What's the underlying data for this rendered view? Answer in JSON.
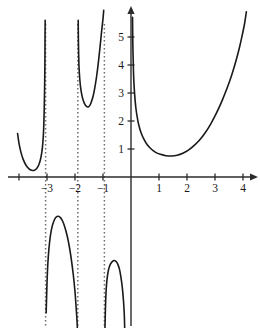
{
  "chart_data": {
    "type": "line",
    "title": "",
    "subtitle": "",
    "xlabel": "",
    "ylabel": "",
    "xlim": [
      -4.4,
      4.45
    ],
    "ylim": [
      -5.4,
      5.95
    ],
    "grid": false,
    "legend": null,
    "axis_origin_px": {
      "x": 131,
      "y": 177
    },
    "px_per_unit": {
      "x": 28.0,
      "y": 28.0
    },
    "x_ticks": [
      {
        "value": -3,
        "label": "−3"
      },
      {
        "value": -2,
        "label": "−2"
      },
      {
        "value": -1,
        "label": "−1"
      },
      {
        "value": 1,
        "label": "1"
      },
      {
        "value": 2,
        "label": "2"
      },
      {
        "value": 3,
        "label": "3"
      },
      {
        "value": 4,
        "label": "4"
      }
    ],
    "x_unlabeled_ticks": [
      -4
    ],
    "y_ticks": [
      {
        "value": 1,
        "label": "1"
      },
      {
        "value": 2,
        "label": "2"
      },
      {
        "value": 3,
        "label": "3"
      },
      {
        "value": 4,
        "label": "4"
      },
      {
        "value": 5,
        "label": "5"
      }
    ],
    "vertical_asymptotes": [
      -3.05,
      -1.9,
      -0.95,
      0
    ],
    "asymptote_style": "dotted",
    "axis_arrows": {
      "x_right": true,
      "y_up": true
    },
    "branches": [
      {
        "name": "far-left-branch",
        "region": "x < -3.05",
        "description": "U-shaped branch above the x-axis, entering at upper left, dipping to a minimum then rising steeply to the asymptote at x = -3.05",
        "points": [
          [
            -4.05,
            1.55
          ],
          [
            -4.0,
            1.2
          ],
          [
            -3.93,
            0.88
          ],
          [
            -3.85,
            0.63
          ],
          [
            -3.75,
            0.42
          ],
          [
            -3.65,
            0.3
          ],
          [
            -3.55,
            0.24
          ],
          [
            -3.45,
            0.24
          ],
          [
            -3.37,
            0.3
          ],
          [
            -3.3,
            0.42
          ],
          [
            -3.24,
            0.6
          ],
          [
            -3.19,
            0.85
          ],
          [
            -3.15,
            1.2
          ],
          [
            -3.12,
            1.7
          ],
          [
            -3.1,
            2.4
          ],
          [
            -3.085,
            3.2
          ],
          [
            -3.075,
            4.1
          ],
          [
            -3.07,
            5.0
          ],
          [
            -3.065,
            5.6
          ]
        ]
      },
      {
        "name": "left-lower-branch",
        "region": "-3.05 < x < -1.9",
        "description": "Inverted U below the x-axis, rising from the asymptote at x = -3.05 to a maximum near x = -2.6, then falling to the asymptote at x = -1.9",
        "points": [
          [
            -3.03,
            -4.85
          ],
          [
            -3.0,
            -3.8
          ],
          [
            -2.97,
            -3.1
          ],
          [
            -2.93,
            -2.55
          ],
          [
            -2.88,
            -2.1
          ],
          [
            -2.82,
            -1.78
          ],
          [
            -2.75,
            -1.56
          ],
          [
            -2.68,
            -1.44
          ],
          [
            -2.6,
            -1.4
          ],
          [
            -2.52,
            -1.45
          ],
          [
            -2.44,
            -1.58
          ],
          [
            -2.36,
            -1.8
          ],
          [
            -2.28,
            -2.1
          ],
          [
            -2.2,
            -2.5
          ],
          [
            -2.13,
            -2.95
          ],
          [
            -2.06,
            -3.5
          ],
          [
            -2.0,
            -4.1
          ],
          [
            -1.96,
            -4.65
          ],
          [
            -1.93,
            -5.1
          ],
          [
            -1.915,
            -5.4
          ]
        ]
      },
      {
        "name": "middle-upper-branch",
        "region": "-1.9 < x < -0.95",
        "description": "U-shaped branch above the x-axis between the asymptotes at x = -1.9 and x = -0.95, with a minimum of about 2.5 near x = -1.55",
        "points": [
          [
            -1.885,
            5.6
          ],
          [
            -1.88,
            5.0
          ],
          [
            -1.87,
            4.4
          ],
          [
            -1.855,
            3.9
          ],
          [
            -1.83,
            3.5
          ],
          [
            -1.8,
            3.2
          ],
          [
            -1.76,
            2.95
          ],
          [
            -1.71,
            2.75
          ],
          [
            -1.65,
            2.6
          ],
          [
            -1.59,
            2.52
          ],
          [
            -1.53,
            2.5
          ],
          [
            -1.47,
            2.56
          ],
          [
            -1.41,
            2.7
          ],
          [
            -1.35,
            2.9
          ],
          [
            -1.29,
            3.2
          ],
          [
            -1.23,
            3.58
          ],
          [
            -1.17,
            4.05
          ],
          [
            -1.11,
            4.6
          ],
          [
            -1.05,
            5.2
          ],
          [
            -1.0,
            5.65
          ],
          [
            -0.975,
            5.95
          ]
        ]
      },
      {
        "name": "middle-lower-branch",
        "region": "-0.95 < x < 0",
        "description": "Small inverted U below the x-axis between the asymptotes at x = -0.95 and x = 0, peaking near x = -0.5",
        "points": [
          [
            -0.93,
            -5.4
          ],
          [
            -0.91,
            -4.6
          ],
          [
            -0.885,
            -4.0
          ],
          [
            -0.85,
            -3.6
          ],
          [
            -0.8,
            -3.3
          ],
          [
            -0.74,
            -3.12
          ],
          [
            -0.67,
            -3.02
          ],
          [
            -0.6,
            -2.98
          ],
          [
            -0.53,
            -3.02
          ],
          [
            -0.47,
            -3.12
          ],
          [
            -0.41,
            -3.3
          ],
          [
            -0.36,
            -3.58
          ],
          [
            -0.31,
            -3.95
          ],
          [
            -0.27,
            -4.4
          ],
          [
            -0.24,
            -4.9
          ],
          [
            -0.225,
            -5.4
          ]
        ]
      },
      {
        "name": "right-branch",
        "region": "x > 0",
        "description": "Branch right of the y-axis falling from the asymptote at x = 0 to a minimum of about 0.75 near x = 1.5, then rising steeply through x = 4",
        "points": [
          [
            0.055,
            5.7
          ],
          [
            0.06,
            5.2
          ],
          [
            0.07,
            4.5
          ],
          [
            0.085,
            3.9
          ],
          [
            0.1,
            3.45
          ],
          [
            0.13,
            2.95
          ],
          [
            0.17,
            2.5
          ],
          [
            0.22,
            2.15
          ],
          [
            0.28,
            1.85
          ],
          [
            0.36,
            1.58
          ],
          [
            0.46,
            1.35
          ],
          [
            0.58,
            1.15
          ],
          [
            0.72,
            1.0
          ],
          [
            0.88,
            0.88
          ],
          [
            1.05,
            0.81
          ],
          [
            1.25,
            0.76
          ],
          [
            1.45,
            0.75
          ],
          [
            1.65,
            0.78
          ],
          [
            1.85,
            0.85
          ],
          [
            2.05,
            0.96
          ],
          [
            2.25,
            1.12
          ],
          [
            2.45,
            1.32
          ],
          [
            2.65,
            1.58
          ],
          [
            2.85,
            1.9
          ],
          [
            3.05,
            2.28
          ],
          [
            3.25,
            2.72
          ],
          [
            3.45,
            3.22
          ],
          [
            3.6,
            3.65
          ],
          [
            3.75,
            4.15
          ],
          [
            3.88,
            4.65
          ],
          [
            3.98,
            5.1
          ],
          [
            4.06,
            5.5
          ],
          [
            4.12,
            5.9
          ]
        ]
      }
    ]
  }
}
